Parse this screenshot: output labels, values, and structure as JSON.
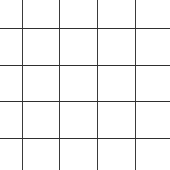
{
  "grid": {
    "line_color": "#3a3a3a",
    "background": "#ffffff",
    "vertical_lines_x": [
      22,
      59,
      97,
      135
    ],
    "horizontal_lines_y": [
      28,
      65,
      101,
      138
    ]
  }
}
